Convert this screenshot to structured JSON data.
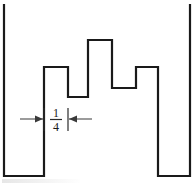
{
  "figure": {
    "canvas": {
      "width": 194,
      "height": 184,
      "background": "#ffffff"
    },
    "stroke_color": "#1a1a1a",
    "dimension_color": "#3a3a3a"
  },
  "dimension": {
    "label_numerator": "1",
    "label_denominator": "4",
    "label_text": "1/4",
    "extension_left_x": 44,
    "extension_right_x": 68,
    "dim_line_y": 119,
    "arrow_direction": "inward"
  },
  "chart_data": {
    "type": "line",
    "xlabel": "",
    "ylabel": "",
    "grid": false,
    "legend": "none",
    "xlim": [
      0,
      194
    ],
    "ylim": [
      0,
      184
    ],
    "note": "Pixel coordinates; y increases downward. Lower y value = taller level.",
    "levels": {
      "baseline_y": 176,
      "top_of_side_walls_y": 4,
      "low_step_y": 97,
      "mid_step_y": 67,
      "peak_y": 40,
      "right_low_step_y": 88
    },
    "x_breakpoints": [
      4,
      44,
      68,
      88,
      112,
      136,
      158,
      190
    ],
    "polyline_points": [
      [
        4,
        4
      ],
      [
        4,
        176
      ],
      [
        44,
        176
      ],
      [
        44,
        67
      ],
      [
        68,
        67
      ],
      [
        68,
        97
      ],
      [
        88,
        97
      ],
      [
        88,
        40
      ],
      [
        112,
        40
      ],
      [
        112,
        88
      ],
      [
        136,
        88
      ],
      [
        136,
        67
      ],
      [
        158,
        67
      ],
      [
        158,
        176
      ],
      [
        190,
        176
      ],
      [
        190,
        4
      ]
    ],
    "segments": [
      {
        "name": "left-wall",
        "x": 4,
        "y_from": 4,
        "y_to": 176,
        "orientation": "vertical"
      },
      {
        "name": "left-floor",
        "y": 176,
        "x_from": 4,
        "x_to": 44,
        "orientation": "horizontal"
      },
      {
        "name": "riser-1",
        "x": 44,
        "y_from": 176,
        "y_to": 67,
        "orientation": "vertical"
      },
      {
        "name": "plateau-1",
        "y": 67,
        "x_from": 44,
        "x_to": 68,
        "orientation": "horizontal"
      },
      {
        "name": "drop-1",
        "x": 68,
        "y_from": 67,
        "y_to": 97,
        "orientation": "vertical"
      },
      {
        "name": "plateau-2",
        "y": 97,
        "x_from": 68,
        "x_to": 88,
        "orientation": "horizontal"
      },
      {
        "name": "riser-2",
        "x": 88,
        "y_from": 97,
        "y_to": 40,
        "orientation": "vertical"
      },
      {
        "name": "peak-plateau",
        "y": 40,
        "x_from": 88,
        "x_to": 112,
        "orientation": "horizontal"
      },
      {
        "name": "drop-2",
        "x": 112,
        "y_from": 40,
        "y_to": 88,
        "orientation": "vertical"
      },
      {
        "name": "plateau-3",
        "y": 88,
        "x_from": 112,
        "x_to": 136,
        "orientation": "horizontal"
      },
      {
        "name": "riser-3",
        "x": 136,
        "y_from": 88,
        "y_to": 67,
        "orientation": "vertical"
      },
      {
        "name": "plateau-4",
        "y": 67,
        "x_from": 136,
        "x_to": 158,
        "orientation": "horizontal"
      },
      {
        "name": "drop-3",
        "x": 158,
        "y_from": 67,
        "y_to": 176,
        "orientation": "vertical"
      },
      {
        "name": "right-floor",
        "y": 176,
        "x_from": 158,
        "x_to": 190,
        "orientation": "horizontal"
      },
      {
        "name": "right-wall",
        "x": 190,
        "y_from": 176,
        "y_to": 4,
        "orientation": "vertical"
      }
    ]
  }
}
